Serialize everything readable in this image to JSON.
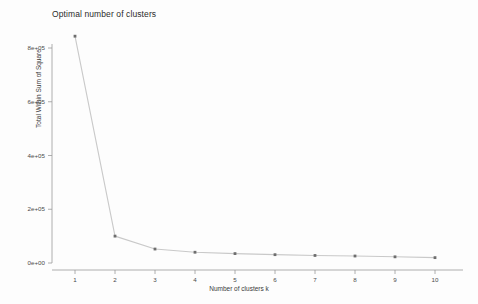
{
  "chart_data": {
    "type": "line",
    "title": "Optimal number of clusters",
    "xlabel": "Number of clusters k",
    "ylabel": "Total Within Sum of Square",
    "x": [
      1,
      2,
      3,
      4,
      5,
      6,
      7,
      8,
      9,
      10
    ],
    "values": [
      844000,
      100000,
      52000,
      40000,
      35000,
      31000,
      28000,
      26000,
      23000,
      20000
    ],
    "categories": [
      "1",
      "2",
      "3",
      "4",
      "5",
      "6",
      "7",
      "8",
      "9",
      "10"
    ],
    "xtick_labels": [
      "1",
      "2",
      "3",
      "4",
      "5",
      "6",
      "7",
      "8",
      "9",
      "10"
    ],
    "ytick_labels": [
      "0e+00",
      "2e+05",
      "4e+05",
      "6e+05",
      "8e+05"
    ],
    "ytick_values": [
      0,
      200000,
      400000,
      600000,
      800000
    ],
    "xlim": [
      0.5,
      10.5
    ],
    "ylim": [
      0,
      880000
    ],
    "grid": false,
    "legend": false,
    "series": [
      {
        "name": "Total Within Sum of Square",
        "values": [
          844000,
          100000,
          52000,
          40000,
          35000,
          31000,
          28000,
          26000,
          23000,
          20000
        ]
      }
    ],
    "colors": {
      "line": "#c9c9c9",
      "point": "#6e6e6e",
      "axis": "#9a9a9a",
      "text": "#3a3a3a",
      "background": "#fdfdfd"
    }
  }
}
